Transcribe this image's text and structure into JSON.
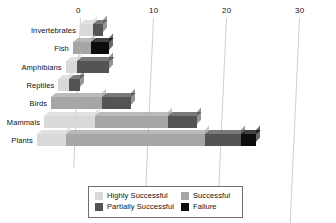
{
  "chart_data": {
    "type": "bar",
    "orientation": "horizontal",
    "stacked": true,
    "style": "3d-perspective",
    "title": "",
    "xlabel": "",
    "ylabel": "",
    "xlim": [
      0,
      30
    ],
    "grid": true,
    "xticks": [
      0,
      10,
      20,
      30
    ],
    "xtick_labels": [
      "0",
      "10",
      "20",
      "30"
    ],
    "categories": [
      "Invertebrates",
      "Fish",
      "Amphibians",
      "Reptiles",
      "Birds",
      "Mammals",
      "Plants"
    ],
    "legend_position": "bottom",
    "series": [
      {
        "name": "Highly Successful",
        "color": "#d9d9d9",
        "values": [
          1.8,
          0,
          1.5,
          1.5,
          0,
          7,
          4
        ]
      },
      {
        "name": "Successful",
        "color": "#a6a6a6",
        "values": [
          0,
          2.5,
          0,
          0,
          7,
          10,
          19
        ]
      },
      {
        "name": "Partially Successful",
        "color": "#545454",
        "values": [
          1.4,
          0,
          4.5,
          1.5,
          4,
          4,
          5
        ]
      },
      {
        "name": "Failure",
        "color": "#0d0d0d",
        "values": [
          0,
          2.5,
          0,
          0,
          0,
          0,
          2
        ]
      }
    ],
    "totals": [
      3.2,
      5,
      6,
      3,
      11,
      21,
      30
    ]
  },
  "legend": {
    "items": [
      {
        "label": "Highly Successful",
        "color": "#d9d9d9"
      },
      {
        "label": "Successful",
        "color": "#a6a6a6"
      },
      {
        "label": "Partially Successful",
        "color": "#545454"
      },
      {
        "label": "Failure",
        "color": "#0d0d0d"
      }
    ]
  },
  "colors": {
    "background": "#ffffff",
    "gridline": "#cfcfcf",
    "text": "#111111",
    "legend_border": "#6f6f6f"
  }
}
